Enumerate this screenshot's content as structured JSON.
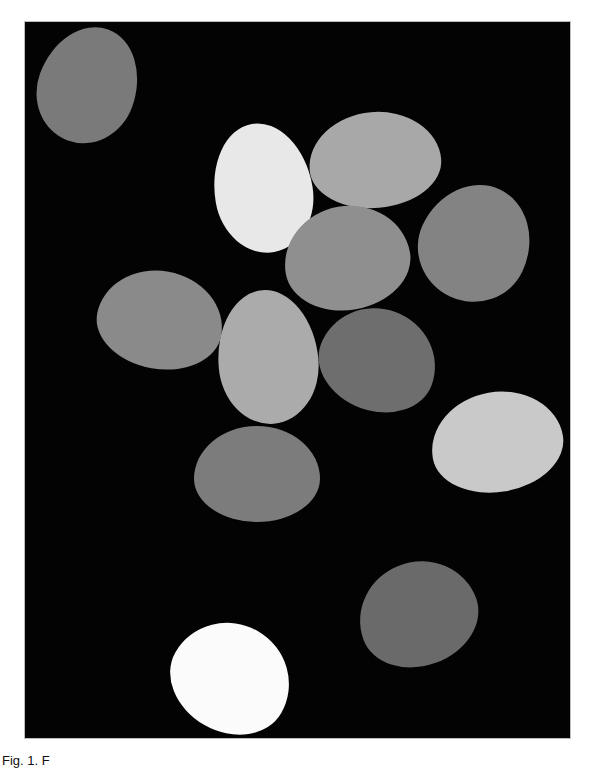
{
  "figure": {
    "background_color": "#030303",
    "frame": {
      "left": 25,
      "top": 22,
      "width": 545,
      "height": 716
    },
    "caption": "Fig. 1. F",
    "objects": [
      {
        "name": "egg-1",
        "cx": 88,
        "cy": 85,
        "w": 98,
        "h": 118,
        "rotate": 20,
        "color": "#7a7a7a"
      },
      {
        "name": "egg-2",
        "cx": 263,
        "cy": 188,
        "w": 98,
        "h": 130,
        "rotate": -10,
        "color": "#e8e8e8"
      },
      {
        "name": "egg-3",
        "cx": 375,
        "cy": 160,
        "w": 132,
        "h": 96,
        "rotate": -5,
        "color": "#a8a8a8"
      },
      {
        "name": "egg-4",
        "cx": 475,
        "cy": 243,
        "w": 110,
        "h": 118,
        "rotate": 25,
        "color": "#838383"
      },
      {
        "name": "egg-5",
        "cx": 347,
        "cy": 258,
        "w": 126,
        "h": 104,
        "rotate": -10,
        "color": "#8f8f8f"
      },
      {
        "name": "egg-6",
        "cx": 160,
        "cy": 320,
        "w": 126,
        "h": 98,
        "rotate": 10,
        "color": "#8a8a8a"
      },
      {
        "name": "egg-7",
        "cx": 268,
        "cy": 357,
        "w": 100,
        "h": 134,
        "rotate": -5,
        "color": "#ababab"
      },
      {
        "name": "egg-8",
        "cx": 378,
        "cy": 360,
        "w": 118,
        "h": 102,
        "rotate": 20,
        "color": "#6e6e6e"
      },
      {
        "name": "egg-9",
        "cx": 497,
        "cy": 442,
        "w": 132,
        "h": 100,
        "rotate": -10,
        "color": "#c9c9c9"
      },
      {
        "name": "egg-10",
        "cx": 257,
        "cy": 474,
        "w": 126,
        "h": 96,
        "rotate": 0,
        "color": "#7c7c7c"
      },
      {
        "name": "egg-11",
        "cx": 418,
        "cy": 614,
        "w": 120,
        "h": 104,
        "rotate": -20,
        "color": "#6a6a6a"
      },
      {
        "name": "egg-12",
        "cx": 231,
        "cy": 678,
        "w": 122,
        "h": 108,
        "rotate": 30,
        "color": "#fbfbfb"
      }
    ]
  }
}
